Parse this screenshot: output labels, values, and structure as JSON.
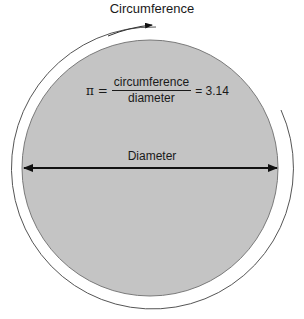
{
  "diagram": {
    "title": "Circumference",
    "formula": {
      "lhs": "π =",
      "numerator": "circumference",
      "denominator": "diameter",
      "rhs": "= 3.14"
    },
    "diameter_label": "Diameter",
    "colors": {
      "circle_fill": "#c4c4c4",
      "circle_stroke": "#7a7a7a",
      "arrow": "#111111",
      "arc": "#555555",
      "background": "#ffffff"
    }
  }
}
